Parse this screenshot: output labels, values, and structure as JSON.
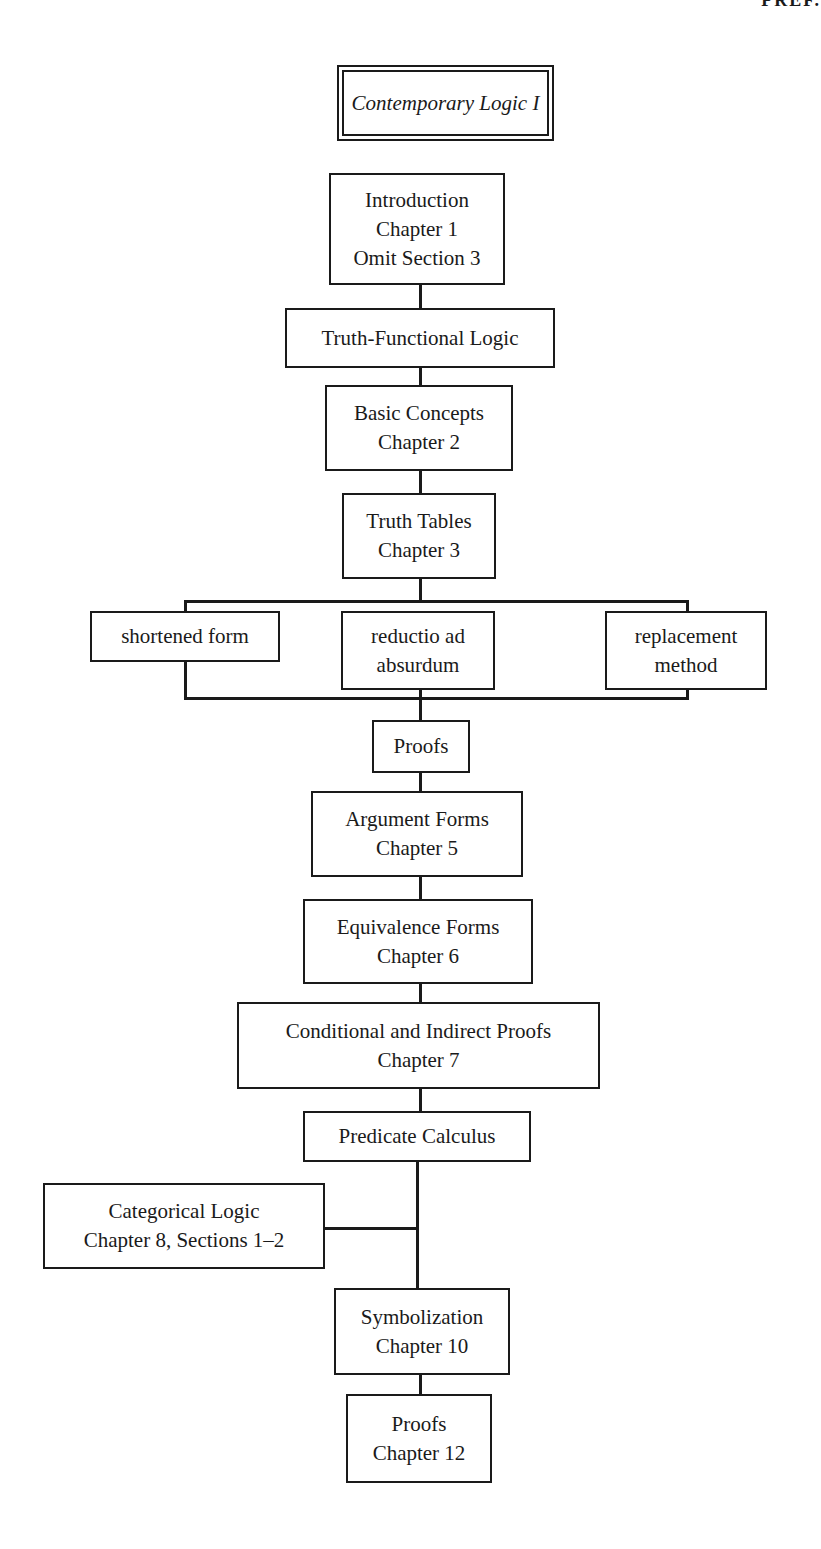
{
  "page": {
    "corner_header_fragment": "PREF."
  },
  "diagram": {
    "title": "Contemporary Logic I",
    "nodes": {
      "introduction": [
        "Introduction",
        "Chapter 1",
        "Omit Section 3"
      ],
      "truth_functional": [
        "Truth-Functional Logic"
      ],
      "basic_concepts": [
        "Basic Concepts",
        "Chapter 2"
      ],
      "truth_tables": [
        "Truth Tables",
        "Chapter 3"
      ],
      "shortened_form": [
        "shortened form"
      ],
      "reductio": [
        "reductio ad",
        "absurdum"
      ],
      "replacement": [
        "replacement",
        "method"
      ],
      "proofs": [
        "Proofs"
      ],
      "argument_forms": [
        "Argument Forms",
        "Chapter 5"
      ],
      "equivalence_forms": [
        "Equivalence Forms",
        "Chapter 6"
      ],
      "conditional_indirect": [
        "Conditional and Indirect Proofs",
        "Chapter 7"
      ],
      "predicate_calculus": [
        "Predicate Calculus"
      ],
      "categorical_logic": [
        "Categorical Logic",
        "Chapter 8, Sections 1–2"
      ],
      "symbolization": [
        "Symbolization",
        "Chapter 10"
      ],
      "proofs_ch12": [
        "Proofs",
        "Chapter 12"
      ]
    }
  }
}
